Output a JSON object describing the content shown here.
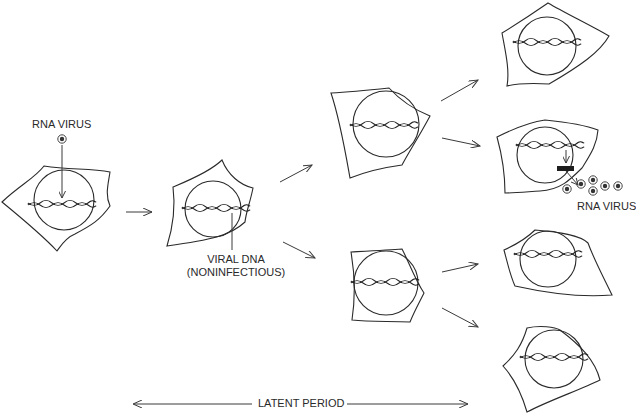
{
  "diagram": {
    "labels": {
      "rna_virus_top": "RNA VIRUS",
      "viral_dna_line1": "VIRAL DNA",
      "viral_dna_line2": "(NONINFECTIOUS)",
      "rna_virus_release": "RNA VIRUS",
      "latent_period": "LATENT PERIOD"
    },
    "nodes": [
      {
        "id": "cell-infected",
        "label": "Infected cell with RNA virus entering nucleus"
      },
      {
        "id": "cell-integrated",
        "label": "Cell with integrated viral DNA"
      },
      {
        "id": "cell-gen2-top",
        "label": "Daughter cell"
      },
      {
        "id": "cell-gen2-bottom",
        "label": "Daughter cell"
      },
      {
        "id": "cell-gen3-1",
        "label": "Granddaughter cell"
      },
      {
        "id": "cell-gen3-2",
        "label": "Granddaughter cell producing RNA virus"
      },
      {
        "id": "cell-gen3-3",
        "label": "Granddaughter cell"
      },
      {
        "id": "cell-gen3-4",
        "label": "Granddaughter cell"
      }
    ],
    "edges": [
      {
        "from": "cell-infected",
        "to": "cell-integrated"
      },
      {
        "from": "cell-integrated",
        "to": "cell-gen2-top"
      },
      {
        "from": "cell-integrated",
        "to": "cell-gen2-bottom"
      },
      {
        "from": "cell-gen2-top",
        "to": "cell-gen3-1"
      },
      {
        "from": "cell-gen2-top",
        "to": "cell-gen3-2"
      },
      {
        "from": "cell-gen2-bottom",
        "to": "cell-gen3-3"
      },
      {
        "from": "cell-gen2-bottom",
        "to": "cell-gen3-4"
      }
    ],
    "released_virions": 6
  }
}
